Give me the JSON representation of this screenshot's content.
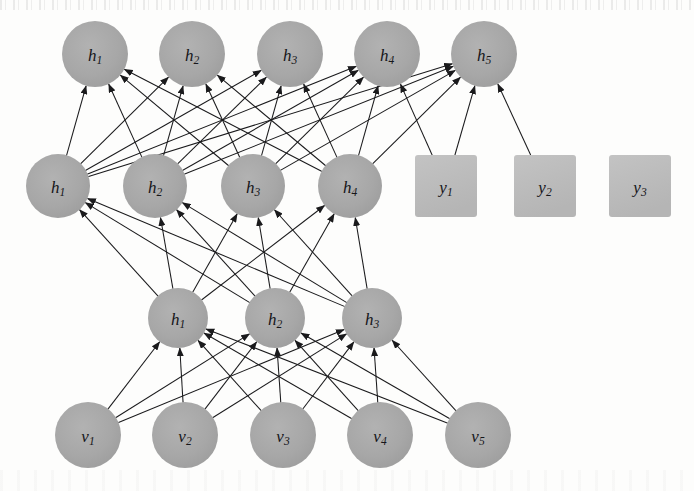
{
  "diagram": {
    "background_color": "#fdfdfc",
    "circle_fill": "#a8a8a8",
    "square_fill": "#bcbcbc",
    "edge_color": "#1a1a1c",
    "label_color": "#16161a"
  },
  "layers": [
    {
      "id": "layer-top-hidden",
      "shape": "circle",
      "radius": 33,
      "center_y": 54,
      "nodes": [
        {
          "base": "h",
          "sub": "1",
          "cx": 95
        },
        {
          "base": "h",
          "sub": "2",
          "cx": 192
        },
        {
          "base": "h",
          "sub": "3",
          "cx": 290
        },
        {
          "base": "h",
          "sub": "4",
          "cx": 387
        },
        {
          "base": "h",
          "sub": "5",
          "cx": 484
        }
      ]
    },
    {
      "id": "layer-second-hidden",
      "shape": "circle",
      "radius": 32,
      "center_y": 186,
      "nodes": [
        {
          "base": "h",
          "sub": "1",
          "cx": 58
        },
        {
          "base": "h",
          "sub": "2",
          "cx": 155
        },
        {
          "base": "h",
          "sub": "3",
          "cx": 253
        },
        {
          "base": "h",
          "sub": "4",
          "cx": 350
        }
      ]
    },
    {
      "id": "layer-label-units",
      "shape": "square",
      "size": 62,
      "center_y": 186,
      "nodes": [
        {
          "base": "y",
          "sub": "1",
          "cx": 446
        },
        {
          "base": "y",
          "sub": "2",
          "cx": 545
        },
        {
          "base": "y",
          "sub": "3",
          "cx": 640
        }
      ]
    },
    {
      "id": "layer-first-hidden",
      "shape": "circle",
      "radius": 30,
      "center_y": 318,
      "nodes": [
        {
          "base": "h",
          "sub": "1",
          "cx": 178
        },
        {
          "base": "h",
          "sub": "2",
          "cx": 275
        },
        {
          "base": "h",
          "sub": "3",
          "cx": 372
        }
      ]
    },
    {
      "id": "layer-visible",
      "shape": "circle",
      "radius": 33,
      "center_y": 435,
      "nodes": [
        {
          "base": "v",
          "sub": "1",
          "cx": 88
        },
        {
          "base": "v",
          "sub": "2",
          "cx": 185
        },
        {
          "base": "v",
          "sub": "3",
          "cx": 283
        },
        {
          "base": "v",
          "sub": "4",
          "cx": 380
        },
        {
          "base": "v",
          "sub": "5",
          "cx": 478
        }
      ]
    }
  ],
  "connections": [
    {
      "from_layer": "layer-second-hidden",
      "to_layer": "layer-top-hidden",
      "style": "bidirectional",
      "fully_connected": true
    },
    {
      "from_layer": "layer-label-units",
      "to_layer": "layer-top-hidden",
      "style": "bidirectional",
      "fully_connected": false,
      "pairs": [
        [
          0,
          3
        ],
        [
          0,
          4
        ],
        [
          1,
          4
        ]
      ]
    },
    {
      "from_layer": "layer-first-hidden",
      "to_layer": "layer-second-hidden",
      "style": "bidirectional",
      "fully_connected": true
    },
    {
      "from_layer": "layer-visible",
      "to_layer": "layer-first-hidden",
      "style": "bidirectional",
      "fully_connected": true
    }
  ]
}
